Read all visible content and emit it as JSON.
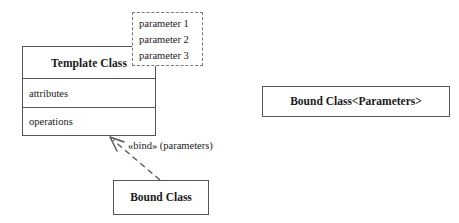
{
  "diagram": {
    "background_color": "#ffffff",
    "line_color": "#555555",
    "dashed_line_color": "#777777",
    "text_color": "#1a1a1a"
  },
  "template_class": {
    "name": "Template Class",
    "attributes_compartment": "attributes",
    "operations_compartment": "operations"
  },
  "parameter_box": {
    "items": [
      "parameter 1",
      "parameter 2",
      "parameter 3"
    ]
  },
  "bound_class": {
    "name": "Bound Class"
  },
  "bound_class_parameters": {
    "name": "Bound Class<Parameters>"
  },
  "binding": {
    "label": "«bind» (parameters)",
    "stereotype": "«bind»",
    "arguments": "(parameters)",
    "line_style": "dashed",
    "arrow_style": "open"
  }
}
